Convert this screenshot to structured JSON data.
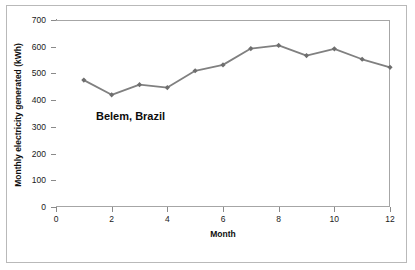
{
  "chart_data": {
    "type": "line",
    "title": "",
    "annotation": "Belem, Brazil",
    "xlabel": "Month",
    "ylabel": "Monthly electricity generated (kWh)",
    "x": [
      1,
      2,
      3,
      4,
      5,
      6,
      7,
      8,
      9,
      10,
      11,
      12
    ],
    "values": [
      475,
      420,
      458,
      447,
      510,
      532,
      593,
      605,
      567,
      592,
      553,
      523
    ],
    "series": [
      {
        "name": "Belem, Brazil",
        "values": [
          475,
          420,
          458,
          447,
          510,
          532,
          593,
          605,
          567,
          592,
          553,
          523
        ]
      }
    ],
    "xlim": [
      0,
      12
    ],
    "ylim": [
      0,
      700
    ],
    "xticks": [
      0,
      2,
      4,
      6,
      8,
      10,
      12
    ],
    "xtick_labels": [
      "0",
      "2",
      "4",
      "6",
      "8",
      "10",
      "12"
    ],
    "yticks": [
      0,
      100,
      200,
      300,
      400,
      500,
      600,
      700
    ],
    "ytick_labels": [
      "0",
      "100",
      "200",
      "300",
      "400",
      "500",
      "600",
      "700"
    ],
    "grid": "horizontal",
    "legend": "none",
    "marker": "diamond",
    "line_color": "#808080",
    "marker_color": "#6e6e6e",
    "grid_color": "#bfbfbf",
    "axis_color": "#8a8a8a"
  }
}
